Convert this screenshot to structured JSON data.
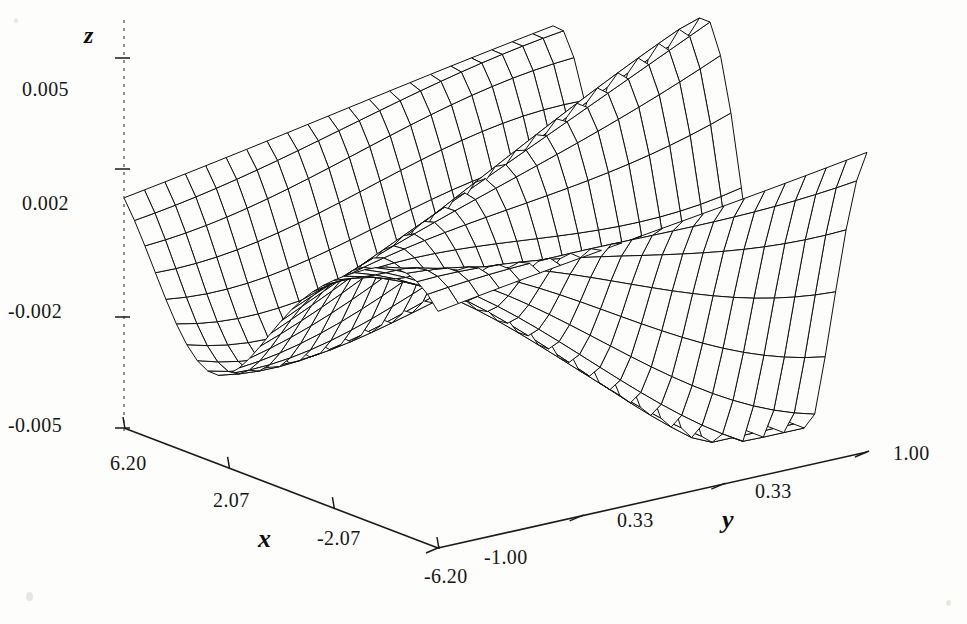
{
  "figure": {
    "kind": "3d-surface-wireframe",
    "background_color": "#fdfdfb",
    "line_color": "#101010",
    "axis_color": "#1a1a1a"
  },
  "axes": {
    "x": {
      "name": "x",
      "tick_labels": [
        "6.20",
        "2.07",
        "-2.07",
        "-6.20"
      ],
      "tick_values": [
        6.2,
        2.07,
        -2.07,
        -6.2
      ],
      "range": [
        -6.2,
        6.2
      ]
    },
    "y": {
      "name": "y",
      "tick_labels": [
        "-1.00",
        "0.33",
        "0.33",
        "1.00"
      ],
      "tick_values": [
        -1.0,
        -0.33,
        0.33,
        1.0
      ],
      "range": [
        -1.0,
        1.0
      ]
    },
    "z": {
      "name": "z",
      "tick_labels": [
        "0.005",
        "0.002",
        "-0.002",
        "-0.005"
      ],
      "tick_values": [
        0.005,
        0.002,
        -0.002,
        -0.005
      ],
      "range": [
        -0.005,
        0.005
      ]
    }
  },
  "chart_data": {
    "type": "surface",
    "title": "",
    "xlabel": "x",
    "ylabel": "y",
    "zlabel": "z",
    "xlim": [
      -6.2,
      6.2
    ],
    "ylim": [
      -1.0,
      1.0
    ],
    "zlim": [
      -0.005,
      0.005
    ],
    "grid": false,
    "legend": "none",
    "mesh_nx": 31,
    "mesh_ny": 22,
    "amplitude": 0.005,
    "x_tick_labels": [
      "6.20",
      "2.07",
      "-2.07",
      "-6.20"
    ],
    "y_tick_labels": [
      "-1.00",
      "0.33",
      "0.33",
      "1.00"
    ],
    "z_tick_labels": [
      "0.005",
      "0.002",
      "-0.002",
      "-0.005"
    ]
  },
  "labels": {
    "z_axis_name": "z",
    "x_axis_name": "x",
    "y_axis_name": "y",
    "z_tick_0": "0.005",
    "z_tick_1": "0.002",
    "z_tick_2": "-0.002",
    "z_tick_3": "-0.005",
    "x_tick_0": "6.20",
    "x_tick_1": "2.07",
    "x_tick_2": "-2.07",
    "x_tick_3": "-6.20",
    "y_tick_0": "-1.00",
    "y_tick_1": "0.33",
    "y_tick_2": "0.33",
    "y_tick_3": "1.00"
  }
}
